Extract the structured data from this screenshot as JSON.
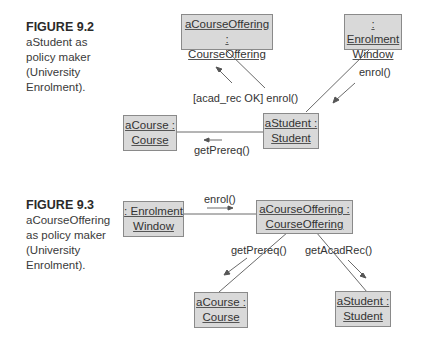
{
  "figures": [
    {
      "id": "9.2",
      "caption": {
        "title": "FIGURE 9.2",
        "lines": [
          "aStudent as",
          "policy maker",
          "(University",
          "Enrolment)."
        ]
      },
      "objects": [
        {
          "name": "aCourseOffering",
          "line1": "aCourseOffering :",
          "line2": "CourseOffering"
        },
        {
          "name": "enrolment-window",
          "line1": ": Enrolment",
          "line2": "Window"
        },
        {
          "name": "aCourse",
          "line1": "aCourse :",
          "line2": "Course"
        },
        {
          "name": "aStudent",
          "line1": "aStudent :",
          "line2": "Student"
        }
      ],
      "messages": [
        {
          "label": "enrol()",
          "from": "Enrolment Window",
          "to": "aStudent"
        },
        {
          "label": "[acad_rec OK] enrol()",
          "from": "aStudent",
          "to": "aCourseOffering"
        },
        {
          "label": "getPrereq()",
          "from": "aStudent",
          "to": "aCourse"
        }
      ]
    },
    {
      "id": "9.3",
      "caption": {
        "title": "FIGURE 9.3",
        "lines": [
          "aCourseOffering",
          "as policy maker",
          "(University",
          "Enrolment)."
        ]
      },
      "objects": [
        {
          "name": "enrolment-window",
          "line1": ": Enrolment",
          "line2": "Window"
        },
        {
          "name": "aCourseOffering",
          "line1": "aCourseOffering :",
          "line2": "CourseOffering"
        },
        {
          "name": "aCourse",
          "line1": "aCourse :",
          "line2": "Course"
        },
        {
          "name": "aStudent",
          "line1": "aStudent :",
          "line2": "Student"
        }
      ],
      "messages": [
        {
          "label": "enrol()",
          "from": "Enrolment Window",
          "to": "aCourseOffering"
        },
        {
          "label": "getPrereq()",
          "from": "aCourseOffering",
          "to": "aCourse"
        },
        {
          "label": "getAcadRec()",
          "from": "aCourseOffering",
          "to": "aStudent"
        }
      ]
    }
  ],
  "colors": {
    "box_fill": "#d9d9d9",
    "box_border": "#8a8a8a",
    "line": "#555555",
    "text": "#333333"
  }
}
